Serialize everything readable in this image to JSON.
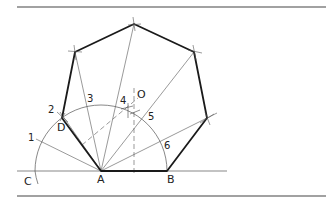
{
  "figure": {
    "labels": {
      "A": "A",
      "B": "B",
      "C": "C",
      "D": "D",
      "O": "O",
      "n1": "1",
      "n2": "2",
      "n3": "3",
      "n4": "4",
      "n5": "5",
      "n6": "6"
    },
    "colors": {
      "ink": "#1a1a1a",
      "thin": "#555555",
      "rule": "#444444",
      "background": "#ffffff"
    },
    "points": {
      "A": [
        101,
        171
      ],
      "B": [
        167,
        171
      ],
      "C": [
        35,
        171
      ],
      "D": [
        62,
        118
      ],
      "O": [
        134,
        110
      ],
      "V3": [
        207,
        118
      ],
      "V4": [
        194,
        52
      ],
      "V5": [
        134,
        24
      ],
      "V6": [
        75,
        52
      ]
    },
    "arc": {
      "center": "A",
      "radius": 66,
      "from": "C",
      "to": "B"
    },
    "divisions": [
      "1",
      "2",
      "3",
      "4",
      "5",
      "6"
    ]
  }
}
